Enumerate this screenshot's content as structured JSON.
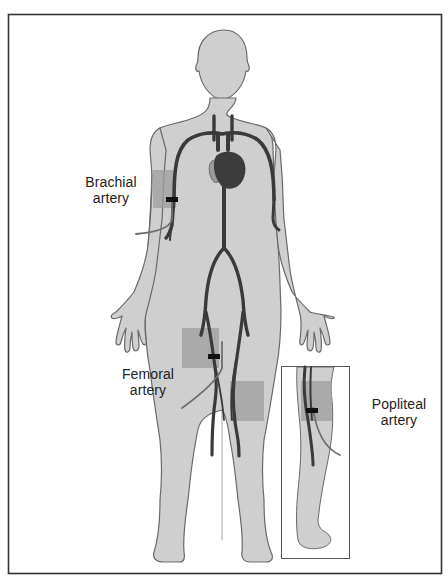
{
  "diagram": {
    "colors": {
      "background": "#ffffff",
      "frame": "#333333",
      "body_fill": "#cfcfcf",
      "body_outline": "#6a6a6a",
      "artery": "#3a3a3a",
      "heart_dark": "#3c3c3c",
      "heart_light": "#9a9a9a",
      "site_highlight": "#a9a9a9",
      "catheter": "#777777"
    },
    "labels": [
      {
        "id": "brachial",
        "line1": "Brachial",
        "line2": "artery"
      },
      {
        "id": "femoral",
        "line1": "Femoral",
        "line2": "artery"
      },
      {
        "id": "popliteal",
        "line1": "Popliteal",
        "line2": "artery"
      }
    ],
    "figures": {
      "main": "Anterior view of human figure with arterial tree and heart",
      "inset": "Posterior view of lower leg showing popliteal artery"
    }
  }
}
